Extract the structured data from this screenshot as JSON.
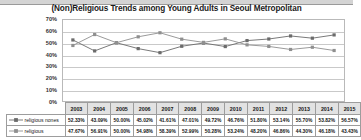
{
  "chart_data": {
    "type": "line",
    "title": "(Non)Religious Trends among Young Adults in Seoul Metropolitan",
    "xlabel": "",
    "ylabel": "",
    "ylim": [
      0,
      70
    ],
    "yticks": [
      "0%",
      "10%",
      "20%",
      "30%",
      "40%",
      "50%",
      "60%",
      "70%"
    ],
    "grid": true,
    "legend_position": "bottom-table",
    "categories": [
      "2003",
      "2004",
      "2005",
      "2006",
      "2007",
      "2008",
      "2009",
      "2010",
      "2011",
      "2012",
      "2013",
      "2014",
      "2015"
    ],
    "series": [
      {
        "name": "religious nones",
        "marker": "square",
        "color": "#6b6b6b",
        "values": [
          52.33,
          43.09,
          50.0,
          45.02,
          41.61,
          47.01,
          49.72,
          46.76,
          51.8,
          53.14,
          55.7,
          53.82,
          56.57
        ],
        "labels": [
          "52.33%",
          "43.09%",
          "50.00%",
          "45.02%",
          "41.61%",
          "47.01%",
          "49.72%",
          "46.76%",
          "51.80%",
          "53.14%",
          "55.70%",
          "53.82%",
          "56.57%"
        ]
      },
      {
        "name": "religious",
        "marker": "square",
        "color": "#8f8f8f",
        "values": [
          47.67,
          56.91,
          50.0,
          54.98,
          58.39,
          52.99,
          50.28,
          53.24,
          48.2,
          46.86,
          44.3,
          46.18,
          43.43
        ],
        "labels": [
          "47.67%",
          "56.91%",
          "50.00%",
          "54.98%",
          "58.39%",
          "52.99%",
          "50.28%",
          "53.24%",
          "48.20%",
          "46.86%",
          "44.30%",
          "46.18%",
          "43.43%"
        ]
      }
    ]
  }
}
